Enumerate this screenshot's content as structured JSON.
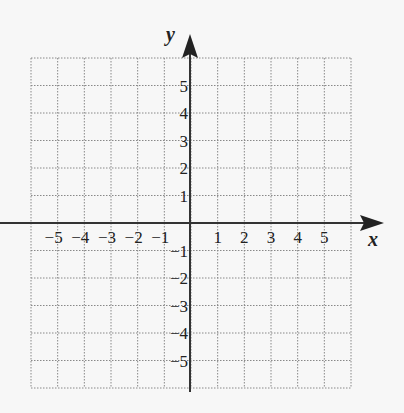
{
  "diagram": {
    "type": "coordinate-grid",
    "x_axis_label": "x",
    "y_axis_label": "y",
    "x_range": [
      -6,
      6
    ],
    "y_range": [
      -6,
      6
    ],
    "x_tick_labels": [
      "−5",
      "−4",
      "−3",
      "−2",
      "−1",
      "1",
      "2",
      "3",
      "4",
      "5"
    ],
    "y_tick_labels": [
      "5",
      "4",
      "3",
      "2",
      "1",
      "−1",
      "−2",
      "−3",
      "−4",
      "−5"
    ],
    "grid_style": "dotted",
    "colors": {
      "background": "#f7f7f7",
      "axis": "#333333",
      "grid": "#888888",
      "text": "#222222"
    }
  }
}
